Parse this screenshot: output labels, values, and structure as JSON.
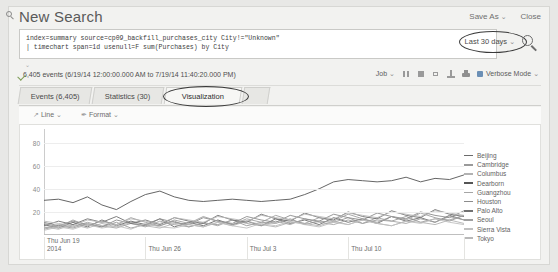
{
  "header": {
    "title": "New Search",
    "search_icon": "search-icon",
    "save_as": "Save As",
    "close": "Close",
    "caret": "⌄"
  },
  "search": {
    "query_lines": [
      "index=summary source=cp09_backfill_purchases_city City!=\"Unknown\"",
      "| timechart span=1d usenull=F sum(Purchases) by City"
    ],
    "time_range": "Last 30 days",
    "time_range_caret": "⌄",
    "submit_icon": "magnifier-icon",
    "expand_caret": "⌄"
  },
  "status": {
    "events_text": "6,405 events (6/19/14 12:00:00.000 AM to 7/19/14 11:40:20.000 PM)",
    "job_label": "Job",
    "job_caret": "⌄",
    "icons": [
      "pause-icon",
      "stop-icon",
      "share-icon",
      "export-icon",
      "print-icon"
    ],
    "verbose_mode": "Verbose Mode",
    "verbose_caret": "⌄"
  },
  "tabs": [
    {
      "label": "Events (6,405)",
      "active": false
    },
    {
      "label": "Statistics (30)",
      "active": false
    },
    {
      "label": "Visualization",
      "active": true
    },
    {
      "label": "",
      "active": false
    }
  ],
  "chart_toolbar": {
    "chart_type": "Line",
    "chart_type_glyph": "↗",
    "chart_type_caret": "⌄",
    "format": "Format",
    "format_glyph": "✒",
    "format_caret": "⌄"
  },
  "chart_data": {
    "type": "line",
    "title": "",
    "xlabel": "",
    "ylabel": "",
    "ylim": [
      0,
      90
    ],
    "yticks": [
      20,
      40,
      60,
      80
    ],
    "grid": true,
    "legend_position": "right",
    "x_tick_labels": [
      {
        "line1": "Thu Jun 19",
        "line2": "2014",
        "index": 0
      },
      {
        "line1": "Thu Jun 26",
        "line2": "",
        "index": 7
      },
      {
        "line1": "Thu Jul 3",
        "line2": "",
        "index": 14
      },
      {
        "line1": "Thu Jul 10",
        "line2": "",
        "index": 21
      }
    ],
    "x": [
      "Jun 19",
      "Jun 20",
      "Jun 21",
      "Jun 22",
      "Jun 23",
      "Jun 24",
      "Jun 25",
      "Jun 26",
      "Jun 27",
      "Jun 28",
      "Jun 29",
      "Jun 30",
      "Jul 1",
      "Jul 2",
      "Jul 3",
      "Jul 4",
      "Jul 5",
      "Jul 6",
      "Jul 7",
      "Jul 8",
      "Jul 9",
      "Jul 10",
      "Jul 11",
      "Jul 12",
      "Jul 13",
      "Jul 14",
      "Jul 15",
      "Jul 16",
      "Jul 17",
      "Jul 18"
    ],
    "series": [
      {
        "name": "Beijing",
        "color": "#6b6b6b",
        "values": [
          9,
          6,
          11,
          7,
          13,
          8,
          12,
          9,
          14,
          7,
          11,
          8,
          13,
          9,
          12,
          8,
          14,
          10,
          13,
          9,
          15,
          11,
          14,
          10,
          16,
          12,
          15,
          11,
          17,
          13
        ]
      },
      {
        "name": "Cambridge",
        "color": "#9a9a9a",
        "values": [
          5,
          8,
          6,
          10,
          7,
          11,
          6,
          9,
          8,
          12,
          7,
          10,
          9,
          13,
          8,
          11,
          10,
          14,
          9,
          12,
          11,
          15,
          10,
          13,
          12,
          16,
          11,
          14,
          13,
          17
        ]
      },
      {
        "name": "Columbus",
        "color": "#b2b2b2",
        "values": [
          7,
          5,
          9,
          6,
          10,
          7,
          11,
          8,
          6,
          10,
          9,
          7,
          11,
          8,
          12,
          9,
          7,
          11,
          10,
          8,
          12,
          9,
          13,
          10,
          8,
          12,
          11,
          9,
          13,
          10
        ]
      },
      {
        "name": "Dearborn",
        "color": "#555555",
        "values": [
          30,
          31,
          28,
          33,
          26,
          22,
          29,
          35,
          38,
          33,
          30,
          29,
          30,
          31,
          30,
          29,
          30,
          31,
          35,
          40,
          46,
          48,
          47,
          46,
          47,
          50,
          46,
          49,
          48,
          52
        ]
      },
      {
        "name": "Guangzhou",
        "color": "#a5a5a5",
        "values": [
          6,
          9,
          7,
          11,
          8,
          6,
          10,
          7,
          12,
          9,
          7,
          11,
          8,
          13,
          10,
          8,
          12,
          9,
          14,
          11,
          9,
          13,
          10,
          15,
          12,
          10,
          14,
          11,
          16,
          13
        ]
      },
      {
        "name": "Houston",
        "color": "#8c8c8c",
        "values": [
          11,
          8,
          12,
          9,
          7,
          13,
          10,
          8,
          14,
          11,
          9,
          15,
          12,
          10,
          16,
          13,
          11,
          17,
          14,
          12,
          18,
          15,
          13,
          19,
          16,
          14,
          20,
          17,
          15,
          21
        ]
      },
      {
        "name": "Palo Alto",
        "color": "#717171",
        "values": [
          8,
          12,
          9,
          14,
          11,
          16,
          10,
          13,
          9,
          15,
          12,
          10,
          17,
          13,
          11,
          18,
          14,
          12,
          19,
          15,
          13,
          20,
          16,
          14,
          21,
          17,
          15,
          22,
          18,
          16
        ]
      },
      {
        "name": "Seoul",
        "color": "#9f9f9f",
        "values": [
          10,
          7,
          13,
          8,
          12,
          9,
          15,
          11,
          8,
          13,
          10,
          16,
          12,
          9,
          14,
          11,
          17,
          13,
          10,
          15,
          12,
          18,
          14,
          11,
          16,
          13,
          19,
          15,
          12,
          17
        ]
      },
      {
        "name": "Sierra Vista",
        "color": "#c0c0c0",
        "values": [
          4,
          7,
          5,
          9,
          6,
          8,
          5,
          10,
          7,
          6,
          9,
          7,
          11,
          8,
          6,
          10,
          8,
          12,
          9,
          7,
          11,
          9,
          13,
          10,
          8,
          12,
          10,
          14,
          11,
          9
        ]
      },
      {
        "name": "Tokyo",
        "color": "#b8b8b8",
        "values": [
          12,
          10,
          8,
          13,
          11,
          9,
          14,
          12,
          10,
          15,
          13,
          11,
          16,
          14,
          12,
          17,
          15,
          13,
          18,
          16,
          14,
          19,
          17,
          15,
          20,
          18,
          16,
          21,
          19,
          17
        ]
      }
    ]
  }
}
